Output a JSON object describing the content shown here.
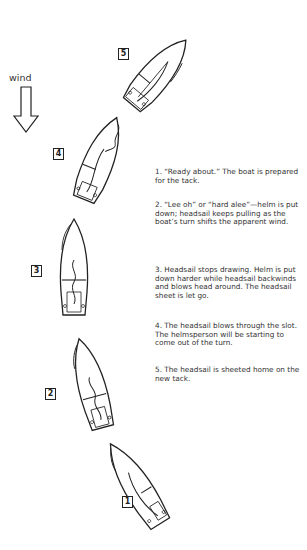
{
  "wind": {
    "label": "wind",
    "icon": "down-arrow-icon"
  },
  "steps": [
    {
      "number": "1",
      "text": "1. “Ready about.” The boat is prepared for the tack.",
      "display": "1. “Ready about.” The boat is pre-\npared for the tack."
    },
    {
      "number": "2",
      "text": "2. “Lee oh” or “hard alee”—helm is put down; headsail keeps pulling as the boat’s turn shifts the apparent wind."
    },
    {
      "number": "3",
      "text": "3. Headsail stops drawing. Helm is put down harder while headsail backwinds and blows head around. The headsail sheet is let go."
    },
    {
      "number": "4",
      "text": "4. The headsail blows through the slot. The helmsperson will be starting to come out of the turn."
    },
    {
      "number": "5",
      "text": "5. The headsail is sheeted home on the new tack."
    }
  ],
  "colors": {
    "line": "#222222",
    "background": "#ffffff"
  }
}
